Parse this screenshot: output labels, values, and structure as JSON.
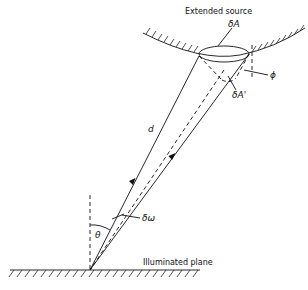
{
  "diagram": {
    "title_source": "Extended source",
    "title_plane": "Illuminated plane",
    "labels": {
      "delta_A": "δA",
      "delta_A_prime": "δA'",
      "phi": "ϕ",
      "d": "d",
      "delta_omega": "δω",
      "theta": "θ"
    },
    "colors": {
      "line": "#111111",
      "background": "#ffffff"
    }
  }
}
